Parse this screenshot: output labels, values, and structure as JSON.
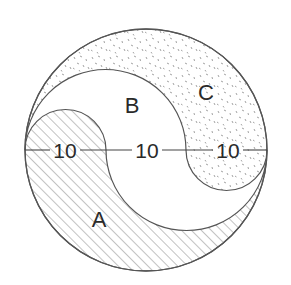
{
  "diagram": {
    "regions": [
      {
        "id": "A",
        "label": "A",
        "pattern": "diagonal-hatch"
      },
      {
        "id": "B",
        "label": "B",
        "pattern": "blank"
      },
      {
        "id": "C",
        "label": "C",
        "pattern": "stipple"
      }
    ],
    "diameter_segments": [
      {
        "label": "10"
      },
      {
        "label": "10"
      },
      {
        "label": "10"
      }
    ],
    "colors": {
      "stroke": "#555555",
      "hatch": "#777777",
      "stipple": "#8a8a8a",
      "text": "#2a2a2a"
    }
  }
}
